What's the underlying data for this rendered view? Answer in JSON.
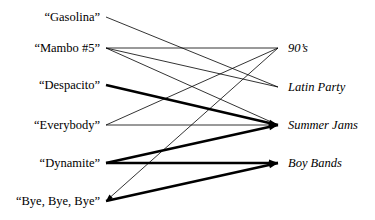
{
  "diagram": {
    "type": "bipartite-graph",
    "width": 375,
    "height": 220,
    "background_color": "#ffffff",
    "edge_color": "#000000",
    "text_color": "#000000",
    "left_column": {
      "label_anchor_x": 100,
      "node_x": 106,
      "nodes": [
        {
          "id": "gasolina",
          "label": "“Gasolina”",
          "y": 17
        },
        {
          "id": "mambo",
          "label": "“Mambo #5”",
          "y": 48
        },
        {
          "id": "despacito",
          "label": "“Despacito”",
          "y": 85
        },
        {
          "id": "everybody",
          "label": "“Everybody”",
          "y": 125
        },
        {
          "id": "dynamite",
          "label": "“Dynamite”",
          "y": 163
        },
        {
          "id": "byebyebye",
          "label": "“Bye, Bye, Bye”",
          "y": 201
        }
      ]
    },
    "right_column": {
      "label_anchor_x": 288,
      "node_x": 278,
      "nodes": [
        {
          "id": "nineties",
          "label": "90’s",
          "y": 48
        },
        {
          "id": "latinparty",
          "label": "Latin Party",
          "y": 87
        },
        {
          "id": "summerjams",
          "label": "Summer Jams",
          "y": 125
        },
        {
          "id": "boybands",
          "label": "Boy Bands",
          "y": 163
        }
      ]
    },
    "edges": [
      {
        "from": "gasolina",
        "to": "latinparty",
        "weight": "thin",
        "stroke_width": 0.8,
        "arrow": false
      },
      {
        "from": "mambo",
        "to": "nineties",
        "weight": "thin",
        "stroke_width": 0.8,
        "arrow": false
      },
      {
        "from": "mambo",
        "to": "latinparty",
        "weight": "thin",
        "stroke_width": 0.8,
        "arrow": false
      },
      {
        "from": "mambo",
        "to": "summerjams",
        "weight": "thin",
        "stroke_width": 0.8,
        "arrow": false
      },
      {
        "from": "despacito",
        "to": "summerjams",
        "weight": "thick",
        "stroke_width": 2.6,
        "arrow": true
      },
      {
        "from": "everybody",
        "to": "nineties",
        "weight": "thin",
        "stroke_width": 0.8,
        "arrow": false
      },
      {
        "from": "everybody",
        "to": "summerjams",
        "weight": "thin",
        "stroke_width": 0.8,
        "arrow": false
      },
      {
        "from": "dynamite",
        "to": "summerjams",
        "weight": "thick",
        "stroke_width": 2.6,
        "arrow": true
      },
      {
        "from": "dynamite",
        "to": "boybands",
        "weight": "thick",
        "stroke_width": 2.6,
        "arrow": true
      },
      {
        "from": "byebyebye",
        "to": "boybands",
        "weight": "thick",
        "stroke_width": 2.6,
        "arrow": true
      },
      {
        "from": "nineties",
        "to": "byebyebye",
        "weight": "thin",
        "stroke_width": 0.8,
        "arrow": true,
        "reverse": true
      }
    ]
  }
}
